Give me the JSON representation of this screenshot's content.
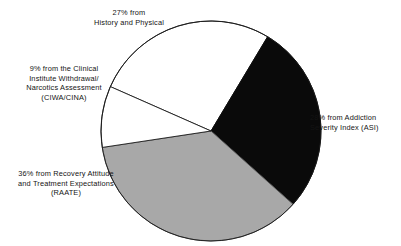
{
  "chart_data": {
    "type": "pie",
    "title": "",
    "subtitle": "",
    "xlabel": "",
    "ylabel": "",
    "legend_position": "callout-labels",
    "grid": false,
    "units": "percent",
    "total": 100,
    "categories": [
      "History and Physical",
      "Addiction Severity Index (ASI)",
      "Recovery Attitude and Treatment Expectations (RAATE)",
      "Clinical Institute Withdrawal/Narcotics Assessment (CIWA/CINA)"
    ],
    "values": [
      27,
      28,
      36,
      9
    ],
    "slices": [
      {
        "key": "hp",
        "percent": 27,
        "label": "27% from\nHistory and Physical",
        "fill": "#ffffff",
        "stroke": "#1a1a1a",
        "start_angle": 262.8,
        "end_angle": 360.0
      },
      {
        "key": "asi",
        "percent": 28,
        "label": "28% from Addiction\nSeverity Index (ASI)",
        "fill": "#0a0a0a",
        "stroke": "#0a0a0a",
        "start_angle": 0.0,
        "end_angle": 100.8
      },
      {
        "key": "raate",
        "percent": 36,
        "label": "36% from Recovery Attitude\nand Treatment Expectations\n(RAATE)",
        "fill": "#a8a8a8",
        "stroke": "#555555",
        "start_angle": 100.8,
        "end_angle": 230.4
      },
      {
        "key": "ciwa",
        "percent": 9,
        "label": "9% from the Clinical\nInstitute Withdrawal/\nNarcotics Assessment\n(CIWA/CINA)",
        "fill": "#ffffff",
        "stroke": "#1a1a1a",
        "start_angle": 230.4,
        "end_angle": 262.8
      }
    ]
  },
  "labels": {
    "history_physical": "27% from\nHistory and Physical",
    "ciwa_cina": "9% from the Clinical\nInstitute Withdrawal/\nNarcotics Assessment\n(CIWA/CINA)",
    "raate": "36% from Recovery Attitude\nand Treatment Expectations\n(RAATE)",
    "asi": "28% from Addiction\nSeverity Index (ASI)"
  },
  "colors": {
    "black_slice": "#0a0a0a",
    "gray_slice": "#a8a8a8",
    "white_slice": "#ffffff",
    "outline": "#1a1a1a",
    "text": "#141414",
    "background": "#ffffff"
  }
}
